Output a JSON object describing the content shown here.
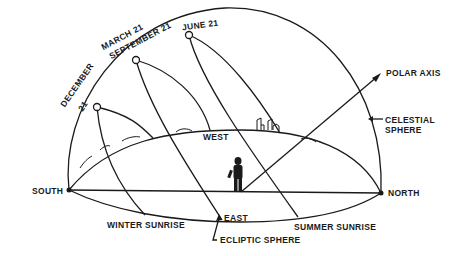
{
  "colors": {
    "ink": "#1a1a1a",
    "background": "#ffffff"
  },
  "labels": {
    "june": "JUNE 21",
    "march": "MARCH 21",
    "september": "SEPTEMBER 21",
    "december": "DECEMBER",
    "december_day": "21",
    "polar_axis": "POLAR   AXIS",
    "celestial": "CELESTIAL",
    "sphere": "SPHERE",
    "west": "WEST",
    "east": "EAST",
    "south": "SOUTH",
    "north": "NORTH",
    "winter_sunrise": "WINTER  SUNRISE",
    "summer_sunrise": "SUMMER   SUNRISE",
    "ecliptic_sphere": "ECLIPTIC   SPHERE"
  }
}
